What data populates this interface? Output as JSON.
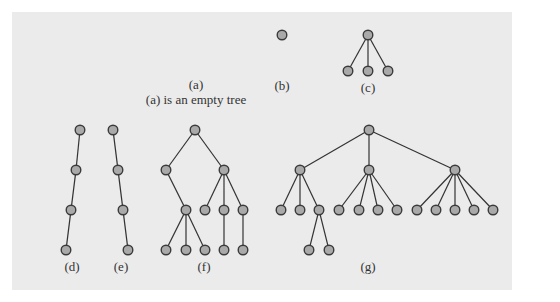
{
  "figure": {
    "colors": {
      "panel": "#ebebeb",
      "node_fill": "#a9a9a9",
      "node_stroke": "#3a3a3a",
      "edge": "#333333"
    },
    "labels": {
      "a": "(a)",
      "a_caption": "(a) is an empty tree",
      "b": "(b)",
      "c": "(c)",
      "d": "(d)",
      "e": "(e)",
      "f": "(f)",
      "g": "(g)"
    },
    "trees": {
      "b": {
        "nodes": [
          [
            282,
            35
          ]
        ],
        "edges": []
      },
      "c": {
        "nodes": [
          [
            368,
            35
          ],
          [
            348,
            71
          ],
          [
            368,
            71
          ],
          [
            388,
            71
          ]
        ],
        "edges": [
          [
            0,
            1
          ],
          [
            0,
            2
          ],
          [
            0,
            3
          ]
        ]
      },
      "d": {
        "nodes": [
          [
            80,
            130
          ],
          [
            76,
            170
          ],
          [
            71,
            210
          ],
          [
            66,
            250
          ]
        ],
        "edges": [
          [
            0,
            1
          ],
          [
            1,
            2
          ],
          [
            2,
            3
          ]
        ]
      },
      "e": {
        "nodes": [
          [
            113,
            130
          ],
          [
            118,
            170
          ],
          [
            123,
            210
          ],
          [
            128,
            250
          ]
        ],
        "edges": [
          [
            0,
            1
          ],
          [
            1,
            2
          ],
          [
            2,
            3
          ]
        ]
      },
      "f": {
        "nodes": [
          [
            195,
            130
          ],
          [
            166,
            170
          ],
          [
            224,
            170
          ],
          [
            186,
            210
          ],
          [
            205,
            210
          ],
          [
            224,
            210
          ],
          [
            243,
            210
          ],
          [
            166,
            250
          ],
          [
            186,
            250
          ],
          [
            205,
            250
          ],
          [
            224,
            250
          ],
          [
            243,
            250
          ]
        ],
        "edges": [
          [
            0,
            1
          ],
          [
            0,
            2
          ],
          [
            1,
            3
          ],
          [
            2,
            4
          ],
          [
            2,
            5
          ],
          [
            2,
            6
          ],
          [
            3,
            7
          ],
          [
            3,
            8
          ],
          [
            3,
            9
          ],
          [
            5,
            10
          ],
          [
            6,
            11
          ]
        ]
      },
      "g": {
        "nodes": [
          [
            369,
            130
          ],
          [
            300,
            170
          ],
          [
            369,
            170
          ],
          [
            455,
            170
          ],
          [
            281,
            210
          ],
          [
            300,
            210
          ],
          [
            319,
            210
          ],
          [
            339,
            210
          ],
          [
            359,
            210
          ],
          [
            378,
            210
          ],
          [
            397,
            210
          ],
          [
            417,
            210
          ],
          [
            436,
            210
          ],
          [
            455,
            210
          ],
          [
            474,
            210
          ],
          [
            493,
            210
          ],
          [
            309,
            250
          ],
          [
            329,
            250
          ]
        ],
        "edges": [
          [
            0,
            1
          ],
          [
            0,
            2
          ],
          [
            0,
            3
          ],
          [
            1,
            4
          ],
          [
            1,
            5
          ],
          [
            1,
            6
          ],
          [
            2,
            7
          ],
          [
            2,
            8
          ],
          [
            2,
            9
          ],
          [
            2,
            10
          ],
          [
            3,
            11
          ],
          [
            3,
            12
          ],
          [
            3,
            13
          ],
          [
            3,
            14
          ],
          [
            3,
            15
          ],
          [
            6,
            16
          ],
          [
            6,
            17
          ]
        ]
      }
    }
  }
}
